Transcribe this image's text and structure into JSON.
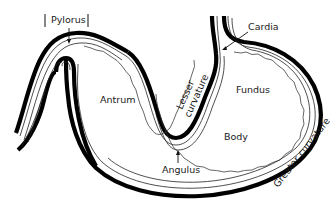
{
  "diagram": {
    "labels": {
      "pylorus": "Pylorus",
      "cardia": "Cardia",
      "antrum": "Antrum",
      "fundus": "Fundus",
      "body": "Body",
      "angulus": "Angulus",
      "lesser_curvature_line1": "Lesser",
      "lesser_curvature_line2": "curvature",
      "greater_curvature": "Greater curvature"
    },
    "colors": {
      "outline": "#000000",
      "background": "#ffffff",
      "text": "#1a1a1a"
    }
  }
}
